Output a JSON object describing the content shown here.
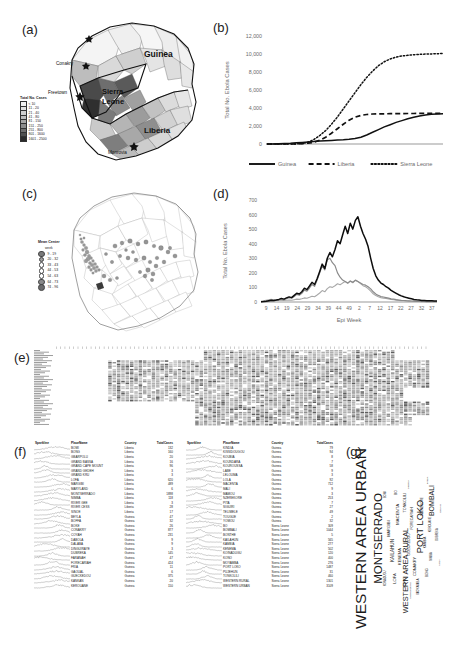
{
  "figure": {
    "panels": {
      "a": "(a)",
      "b": "(b)",
      "c": "(c)",
      "d": "(d)",
      "e": "(e)",
      "f": "(f)",
      "g": "(g)"
    }
  },
  "panel_a": {
    "legend_title": "Total No. Cases",
    "classes": [
      {
        "label": "< 10",
        "color": "#f2f2f2"
      },
      {
        "label": "11 - 20",
        "color": "#e2e2e2"
      },
      {
        "label": "21 - 40",
        "color": "#cfcfcf"
      },
      {
        "label": "41 - 80",
        "color": "#bdbdbd"
      },
      {
        "label": "81 - 150",
        "color": "#a6a6a6"
      },
      {
        "label": "151 - 250",
        "color": "#8c8c8c"
      },
      {
        "label": "251 - 800",
        "color": "#6e6e6e"
      },
      {
        "label": "801 - 1600",
        "color": "#4f4f4f"
      },
      {
        "label": "1601 - 2500",
        "color": "#2b2b2b"
      }
    ],
    "country_labels": [
      "Guinea",
      "Sierra Leone",
      "Liberia"
    ],
    "city_labels": [
      "Conakry",
      "Freetown",
      "Monrovia"
    ]
  },
  "panel_c": {
    "legend_title": "Mean Center",
    "legend_subtitle": "week",
    "classes": [
      {
        "label": "9 - 19",
        "size": 4.2,
        "color": "#7a7a7a"
      },
      {
        "label": "20 - 32",
        "size": 3.8,
        "color": "#9e9e9e"
      },
      {
        "label": "33 - 43",
        "size": 3.4,
        "color": "#ffffff"
      },
      {
        "label": "44 - 53",
        "size": 3.6,
        "color": "#ffffff"
      },
      {
        "label": "54 - 63",
        "size": 3.9,
        "color": "#ffffff"
      },
      {
        "label": "64 - 73",
        "size": 4.3,
        "color": "#8a8a8a"
      },
      {
        "label": "74 - 96",
        "size": 4.8,
        "color": "#6b6b6b"
      }
    ]
  },
  "chart_data": [
    {
      "panel": "b",
      "type": "line",
      "title": "",
      "xlabel": "",
      "ylabel": "Total No. Ebola Cases",
      "ylim": [
        0,
        12000
      ],
      "yticks": [
        0,
        2000,
        4000,
        6000,
        8000,
        10000,
        12000
      ],
      "ytick_labels": [
        "0",
        "2,000",
        "4,000",
        "6,000",
        "8,000",
        "10,000",
        "12,000"
      ],
      "x": [
        1,
        3,
        5,
        7,
        9,
        11,
        13,
        15,
        17,
        19,
        21,
        23,
        25,
        27,
        29,
        31,
        33,
        35,
        37,
        39,
        41,
        43,
        45,
        47,
        49,
        51,
        53,
        55,
        57,
        59,
        61
      ],
      "legend_position": "bottom",
      "series": [
        {
          "name": "Guinea",
          "style": "solid",
          "values": [
            5,
            10,
            20,
            40,
            80,
            130,
            180,
            230,
            280,
            320,
            360,
            400,
            430,
            470,
            520,
            600,
            760,
            1000,
            1300,
            1600,
            1900,
            2150,
            2400,
            2600,
            2800,
            2980,
            3120,
            3230,
            3300,
            3340,
            3360
          ]
        },
        {
          "name": "Liberia",
          "style": "dashed",
          "values": [
            0,
            0,
            0,
            0,
            5,
            15,
            40,
            90,
            200,
            420,
            760,
            1200,
            1700,
            2200,
            2650,
            2980,
            3180,
            3280,
            3330,
            3350,
            3360,
            3370,
            3375,
            3380,
            3385,
            3390,
            3395,
            3400,
            3405,
            3410,
            3415
          ]
        },
        {
          "name": "Sierra Leone",
          "style": "dotted",
          "values": [
            0,
            0,
            0,
            0,
            2,
            10,
            60,
            200,
            500,
            950,
            1500,
            2200,
            3000,
            3900,
            4800,
            5700,
            6600,
            7400,
            8100,
            8700,
            9150,
            9450,
            9650,
            9780,
            9860,
            9920,
            9960,
            9990,
            10010,
            10030,
            10050
          ]
        }
      ]
    },
    {
      "panel": "d",
      "type": "line",
      "title": "",
      "xlabel": "Epi Week",
      "ylabel": "Total No. Ebola Cases",
      "ylim": [
        0,
        700
      ],
      "yticks": [
        0,
        100,
        200,
        300,
        400,
        500,
        600,
        700
      ],
      "ytick_labels": [
        "0",
        "100",
        "200",
        "300",
        "400",
        "500",
        "600",
        "700"
      ],
      "xtick_labels": [
        "9",
        "14",
        "19",
        "24",
        "29",
        "34",
        "39",
        "44",
        "49",
        "2",
        "7",
        "12",
        "17",
        "22",
        "27",
        "32",
        "37"
      ],
      "series": [
        {
          "name": "Total",
          "style": "solid-dark",
          "values": [
            2,
            3,
            5,
            8,
            12,
            10,
            14,
            18,
            25,
            20,
            28,
            35,
            30,
            45,
            60,
            55,
            70,
            95,
            85,
            110,
            135,
            120,
            160,
            210,
            260,
            230,
            300,
            340,
            310,
            360,
            420,
            400,
            460,
            520,
            470,
            540,
            500,
            560,
            585,
            520,
            470,
            430,
            380,
            300,
            230,
            180,
            150,
            130,
            120,
            105,
            95,
            80,
            70,
            60,
            50,
            42,
            36,
            30,
            26,
            22,
            18,
            15,
            13,
            11,
            10,
            9,
            8,
            8,
            7,
            7
          ]
        },
        {
          "name": "Series2",
          "style": "solid-mid",
          "values": [
            1,
            2,
            3,
            5,
            9,
            7,
            10,
            13,
            18,
            15,
            22,
            30,
            26,
            38,
            52,
            46,
            60,
            82,
            74,
            96,
            120,
            108,
            150,
            200,
            250,
            220,
            290,
            300,
            270,
            250,
            200,
            170,
            150,
            140,
            130,
            145,
            135,
            150,
            140,
            130,
            120,
            115,
            105,
            90,
            70,
            55,
            45,
            38,
            34,
            30,
            26,
            22,
            19,
            16,
            14,
            12,
            10,
            9,
            8,
            7,
            6,
            5,
            5,
            4,
            4,
            3,
            3,
            3,
            2,
            2
          ]
        },
        {
          "name": "Series3",
          "style": "solid-light",
          "values": [
            5,
            8,
            12,
            15,
            18,
            14,
            16,
            14,
            12,
            10,
            12,
            14,
            12,
            16,
            20,
            18,
            22,
            28,
            26,
            32,
            40,
            36,
            48,
            62,
            78,
            70,
            92,
            105,
            100,
            112,
            125,
            118,
            130,
            140,
            128,
            142,
            132,
            148,
            140,
            126,
            112,
            104,
            92,
            74,
            56,
            44,
            36,
            30,
            27,
            24,
            21,
            18,
            15,
            13,
            11,
            9,
            8,
            7,
            6,
            5,
            5,
            4,
            4,
            3,
            3,
            3,
            2,
            2,
            2,
            2
          ]
        }
      ]
    }
  ],
  "panel_e": {
    "description": "heatmap-matrix"
  },
  "panel_f": {
    "columns": [
      "Sparkline",
      "PlaceName",
      "Country",
      "TotalCases"
    ],
    "left_rows": [
      {
        "place": "BOMI",
        "country": "Liberia",
        "cases": "132"
      },
      {
        "place": "BONG",
        "country": "Liberia",
        "cases": "160"
      },
      {
        "place": "GBARPOLU",
        "country": "Liberia",
        "cases": "20"
      },
      {
        "place": "GRAND BASSA",
        "country": "Liberia",
        "cases": "16"
      },
      {
        "place": "GRAND CAPE MOUNT",
        "country": "Liberia",
        "cases": "96"
      },
      {
        "place": "GRAND GEDEH",
        "country": "Liberia",
        "cases": "3"
      },
      {
        "place": "GRAND KRU",
        "country": "Liberia",
        "cases": "3"
      },
      {
        "place": "LOFA",
        "country": "Liberia",
        "cases": "620"
      },
      {
        "place": "MARGIBI",
        "country": "Liberia",
        "cases": "489"
      },
      {
        "place": "MARYLAND",
        "country": "Liberia",
        "cases": "6"
      },
      {
        "place": "MONTSERRADO",
        "country": "Liberia",
        "cases": "1898"
      },
      {
        "place": "NIMBA",
        "country": "Liberia",
        "cases": "118"
      },
      {
        "place": "RIVER GEE",
        "country": "Liberia",
        "cases": "3"
      },
      {
        "place": "RIVER CESS",
        "country": "Liberia",
        "cases": "28"
      },
      {
        "place": "SINOE",
        "country": "Liberia",
        "cases": "17"
      },
      {
        "place": "BEYLA",
        "country": "Guinea",
        "cases": "47"
      },
      {
        "place": "BOFFA",
        "country": "Guinea",
        "cases": "32"
      },
      {
        "place": "BOKE",
        "country": "Guinea",
        "cases": "26"
      },
      {
        "place": "CONAKRY",
        "country": "Guinea",
        "cases": "877"
      },
      {
        "place": "COYAH",
        "country": "Guinea",
        "cases": "231"
      },
      {
        "place": "DABOLA",
        "country": "Guinea",
        "cases": "9"
      },
      {
        "place": "DALABA",
        "country": "Guinea",
        "cases": "9"
      },
      {
        "place": "DINGUIRAYE",
        "country": "Guinea",
        "cases": "3"
      },
      {
        "place": "DUBREKA",
        "country": "Guinea",
        "cases": "145"
      },
      {
        "place": "FARANAH",
        "country": "Guinea",
        "cases": "47"
      },
      {
        "place": "FORECARIAH",
        "country": "Guinea",
        "cases": "424"
      },
      {
        "place": "FRIA",
        "country": "Guinea",
        "cases": "11"
      },
      {
        "place": "GAOUAL",
        "country": "Guinea",
        "cases": "6"
      },
      {
        "place": "GUECKEDOU",
        "country": "Guinea",
        "cases": "375"
      },
      {
        "place": "KANKAN",
        "country": "Guinea",
        "cases": "20"
      },
      {
        "place": "KEROUANE",
        "country": "Guinea",
        "cases": "150"
      }
    ],
    "right_rows": [
      {
        "place": "KINDIA",
        "country": "Guinea",
        "cases": "79"
      },
      {
        "place": "KISSIDOUGOU",
        "country": "Guinea",
        "cases": "94"
      },
      {
        "place": "KOUBIA",
        "country": "Guinea",
        "cases": "8"
      },
      {
        "place": "KOUNDARA",
        "country": "Guinea",
        "cases": "7"
      },
      {
        "place": "KOUROUSSA",
        "country": "Guinea",
        "cases": "58"
      },
      {
        "place": "LABE",
        "country": "Guinea",
        "cases": "9"
      },
      {
        "place": "LELOUMA",
        "country": "Guinea",
        "cases": "3"
      },
      {
        "place": "LOLA",
        "country": "Guinea",
        "cases": "92"
      },
      {
        "place": "MACENTA",
        "country": "Guinea",
        "cases": "712"
      },
      {
        "place": "MALI",
        "country": "Guinea",
        "cases": "9"
      },
      {
        "place": "MAMOU",
        "country": "Guinea",
        "cases": "3"
      },
      {
        "place": "NZEREKORE",
        "country": "Guinea",
        "cases": "253"
      },
      {
        "place": "PITA",
        "country": "Guinea",
        "cases": "7"
      },
      {
        "place": "SIGUIRI",
        "country": "Guinea",
        "cases": "27"
      },
      {
        "place": "TELIMELE",
        "country": "Guinea",
        "cases": "49"
      },
      {
        "place": "TOUGUE",
        "country": "Guinea",
        "cases": "2"
      },
      {
        "place": "YOMOU",
        "country": "Guinea",
        "cases": "32"
      },
      {
        "place": "BO",
        "country": "Sierra Leone",
        "cases": "309"
      },
      {
        "place": "BOMBALI",
        "country": "Sierra Leone",
        "cases": "1044"
      },
      {
        "place": "BONTHE",
        "country": "Sierra Leone",
        "cases": "5"
      },
      {
        "place": "KAILAHUN",
        "country": "Sierra Leone",
        "cases": "565"
      },
      {
        "place": "KAMBIA",
        "country": "Sierra Leone",
        "cases": "277"
      },
      {
        "place": "KENEMA",
        "country": "Sierra Leone",
        "cases": "502"
      },
      {
        "place": "KOINADUGU",
        "country": "Sierra Leone",
        "cases": "120"
      },
      {
        "place": "KONO",
        "country": "Sierra Leone",
        "cases": "400"
      },
      {
        "place": "MOYAMBA",
        "country": "Sierra Leone",
        "cases": "276"
      },
      {
        "place": "PORT LOKO",
        "country": "Sierra Leone",
        "cases": "1487"
      },
      {
        "place": "PUJEHUN",
        "country": "Sierra Leone",
        "cases": "31"
      },
      {
        "place": "TONKOLILI",
        "country": "Sierra Leone",
        "cases": "460"
      },
      {
        "place": "WESTERN RURAL",
        "country": "Sierra Leone",
        "cases": "1301"
      },
      {
        "place": "WESTERN URBAN",
        "country": "Sierra Leone",
        "cases": "3109"
      }
    ]
  },
  "panel_g": {
    "type": "wordcloud",
    "words": [
      {
        "text": "WESTERN AREA URBAN",
        "size": 15.5,
        "x": 50,
        "y": 20,
        "rot": 0,
        "weight": "400"
      },
      {
        "text": "MONTSERRADO",
        "size": 11.5,
        "x": 50,
        "y": 36,
        "rot": 0,
        "weight": "400"
      },
      {
        "text": "WESTERN AREA RURAL",
        "size": 7.4,
        "x": 34,
        "y": 63,
        "rot": 0,
        "weight": "400"
      },
      {
        "text": "PORT LOKO",
        "size": 9.2,
        "x": 56,
        "y": 76,
        "rot": 0,
        "weight": "400"
      },
      {
        "text": "BOMBALI",
        "size": 7.0,
        "x": 69,
        "y": 88,
        "rot": 0,
        "weight": "400"
      },
      {
        "text": "KAILAHUN",
        "size": 4.6,
        "x": 44,
        "y": 50,
        "rot": 0,
        "weight": "400"
      },
      {
        "text": "MACENTA",
        "size": 4.4,
        "x": 62,
        "y": 55,
        "rot": 0,
        "weight": "400"
      },
      {
        "text": "LOFA",
        "size": 4.2,
        "x": 30,
        "y": 52,
        "rot": 0,
        "weight": "400"
      },
      {
        "text": "KENEMA",
        "size": 4.0,
        "x": 41,
        "y": 57,
        "rot": 0,
        "weight": "400"
      },
      {
        "text": "MARGIBI",
        "size": 3.9,
        "x": 55,
        "y": 47,
        "rot": 0,
        "weight": "400"
      },
      {
        "text": "TONKOLILI",
        "size": 3.8,
        "x": 68,
        "y": 62,
        "rot": 0,
        "weight": "400"
      },
      {
        "text": "KONO",
        "size": 3.6,
        "x": 28,
        "y": 62,
        "rot": 0,
        "weight": "400"
      },
      {
        "text": "GUECKEDOU",
        "size": 3.5,
        "x": 47,
        "y": 66,
        "rot": 0,
        "weight": "400"
      },
      {
        "text": "BO",
        "size": 3.4,
        "x": 73,
        "y": 53,
        "rot": 0,
        "weight": "400"
      },
      {
        "text": "CONAKRY",
        "size": 3.9,
        "x": 36,
        "y": 71,
        "rot": 0,
        "weight": "400"
      },
      {
        "text": "FORECARIAH",
        "size": 3.4,
        "x": 60,
        "y": 69,
        "rot": 0,
        "weight": "400"
      },
      {
        "text": "MOYAMBA",
        "size": 3.2,
        "x": 26,
        "y": 74,
        "rot": 0,
        "weight": "400"
      },
      {
        "text": "KAMBIA",
        "size": 3.1,
        "x": 48,
        "y": 81,
        "rot": 0,
        "weight": "400"
      },
      {
        "text": "NZEREKORE",
        "size": 3.0,
        "x": 66,
        "y": 78,
        "rot": 0,
        "weight": "400"
      },
      {
        "text": "BONG",
        "size": 3.0,
        "x": 33,
        "y": 83,
        "rot": 0,
        "weight": "400"
      },
      {
        "text": "KEROUANE",
        "size": 2.8,
        "x": 57,
        "y": 86,
        "rot": 0,
        "weight": "400"
      },
      {
        "text": "NIMBA",
        "size": 2.7,
        "x": 41,
        "y": 88,
        "rot": 0,
        "weight": "400"
      },
      {
        "text": "BOMI",
        "size": 2.7,
        "x": 72,
        "y": 44,
        "rot": 0,
        "weight": "400"
      },
      {
        "text": "KOINADUGU",
        "size": 2.6,
        "x": 30,
        "y": 44,
        "rot": 0,
        "weight": "400"
      },
      {
        "text": "DUBREKA",
        "size": 2.6,
        "x": 52,
        "y": 93,
        "rot": 0,
        "weight": "400"
      },
      {
        "text": "COYAH",
        "size": 2.5,
        "x": 65,
        "y": 96,
        "rot": 0,
        "weight": "400"
      },
      {
        "text": "LOLA",
        "size": 2.4,
        "x": 38,
        "y": 95,
        "rot": 0,
        "weight": "400"
      },
      {
        "text": "LIBERIA",
        "size": 2.4,
        "x": 77,
        "y": 66,
        "rot": 0,
        "weight": "400"
      },
      {
        "text": "KISSIDOUGOU",
        "size": 2.3,
        "x": 24,
        "y": 67,
        "rot": 0,
        "weight": "400"
      },
      {
        "text": "KINDIA",
        "size": 2.3,
        "x": 79,
        "y": 83,
        "rot": 0,
        "weight": "400"
      }
    ]
  }
}
